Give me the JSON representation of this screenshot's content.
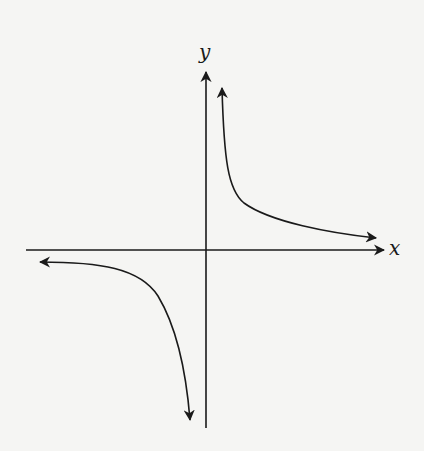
{
  "diagram": {
    "type": "graph-of-function",
    "axes": {
      "x_label": "x",
      "y_label": "y"
    },
    "curves": [
      {
        "name": "branch-quadrant-1",
        "direction": "up-left to right, approaching both axes"
      },
      {
        "name": "branch-quadrant-3",
        "direction": "left to down, approaching both axes"
      }
    ],
    "colors": {
      "stroke": "#1a1a1a",
      "background": "#f5f5f3"
    }
  }
}
